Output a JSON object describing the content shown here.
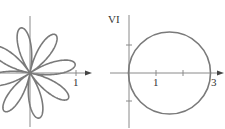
{
  "left_plot": {
    "type": "polar rose",
    "petals": 8,
    "x_tick_label": "1"
  },
  "right_plot": {
    "type": "polar circle",
    "panel_label": "VI",
    "x_tick_labels": [
      "1",
      "3"
    ]
  },
  "colors": {
    "curve": "#7a7a7a",
    "axis": "#8a8a8a",
    "text": "#333333"
  }
}
